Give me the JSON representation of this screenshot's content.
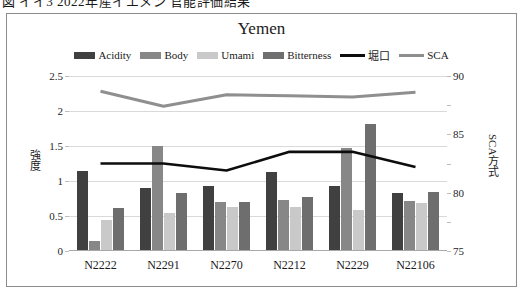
{
  "caption": "図 イイ3 2022年産イエメン 官能評価結果",
  "chart": {
    "title": "Yemen",
    "legend": [
      {
        "label": "Acidity",
        "type": "bar",
        "color": "#404040",
        "icon": "legend-swatch"
      },
      {
        "label": "Body",
        "type": "bar",
        "color": "#878787",
        "icon": "legend-swatch"
      },
      {
        "label": "Umami",
        "type": "bar",
        "color": "#c9c9c9",
        "icon": "legend-swatch"
      },
      {
        "label": "Bitterness",
        "type": "bar",
        "color": "#6e6e6e",
        "icon": "legend-swatch"
      },
      {
        "label": "堀口",
        "type": "line",
        "color": "#0d0d0d",
        "icon": "legend-line"
      },
      {
        "label": "SCA",
        "type": "line",
        "color": "#8f8f8f",
        "icon": "legend-line"
      }
    ],
    "left_ticks": [
      "2.5",
      "2",
      "1.5",
      "1",
      "0.5",
      "0"
    ],
    "right_ticks": [
      "90",
      "85",
      "80",
      "75"
    ],
    "ylabel_left": "強度",
    "ylabel_right": "SCA方式"
  },
  "chart_data": {
    "type": "bar",
    "title": "Yemen",
    "xlabel": "",
    "ylabel": "強度",
    "ylabel_secondary": "SCA方式",
    "categories": [
      "N2222",
      "N2291",
      "N2270",
      "N2212",
      "N2229",
      "N22106"
    ],
    "ylim": [
      0,
      2.5
    ],
    "ylim_secondary": [
      75,
      90
    ],
    "yticks": [
      0,
      0.5,
      1,
      1.5,
      2,
      2.5
    ],
    "yticks_secondary": [
      75,
      80,
      85,
      90
    ],
    "grid": true,
    "legend_position": "top",
    "series": [
      {
        "name": "Acidity",
        "type": "bar",
        "axis": "left",
        "color": "#404040",
        "values": [
          1.15,
          0.9,
          0.93,
          1.13,
          0.93,
          0.83
        ]
      },
      {
        "name": "Body",
        "type": "bar",
        "axis": "left",
        "color": "#878787",
        "values": [
          0.15,
          1.5,
          0.7,
          0.73,
          1.47,
          0.72
        ]
      },
      {
        "name": "Umami",
        "type": "bar",
        "axis": "left",
        "color": "#c9c9c9",
        "values": [
          0.45,
          0.55,
          0.63,
          0.63,
          0.58,
          0.68
        ]
      },
      {
        "name": "Bitterness",
        "type": "bar",
        "axis": "left",
        "color": "#6e6e6e",
        "values": [
          0.62,
          0.83,
          0.7,
          0.77,
          1.82,
          0.85
        ]
      },
      {
        "name": "堀口",
        "type": "line",
        "axis": "right",
        "color": "#0d0d0d",
        "values": [
          82.5,
          82.5,
          81.9,
          83.5,
          83.5,
          82.2
        ]
      },
      {
        "name": "SCA",
        "type": "line",
        "axis": "right",
        "color": "#8f8f8f",
        "values": [
          88.7,
          87.4,
          88.4,
          88.3,
          88.2,
          88.6
        ]
      }
    ]
  }
}
